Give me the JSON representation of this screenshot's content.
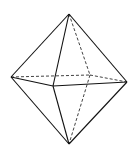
{
  "diagram": {
    "shape": "octahedron",
    "stroke_color": "#111111",
    "background": "#ffffff",
    "vertices": {
      "top": [
        69,
        14
      ],
      "left": [
        11,
        77
      ],
      "front": [
        53,
        86
      ],
      "right": [
        127,
        82
      ],
      "back": [
        90,
        75
      ],
      "bottom": [
        69,
        144
      ]
    },
    "solid_edges": [
      [
        "top",
        "left"
      ],
      [
        "top",
        "front"
      ],
      [
        "top",
        "right"
      ],
      [
        "left",
        "front"
      ],
      [
        "front",
        "right"
      ],
      [
        "bottom",
        "left"
      ],
      [
        "bottom",
        "front"
      ],
      [
        "bottom",
        "right"
      ]
    ],
    "hidden_edges": [
      [
        "top",
        "back"
      ],
      [
        "left",
        "back"
      ],
      [
        "back",
        "right"
      ],
      [
        "back",
        "bottom"
      ]
    ]
  }
}
